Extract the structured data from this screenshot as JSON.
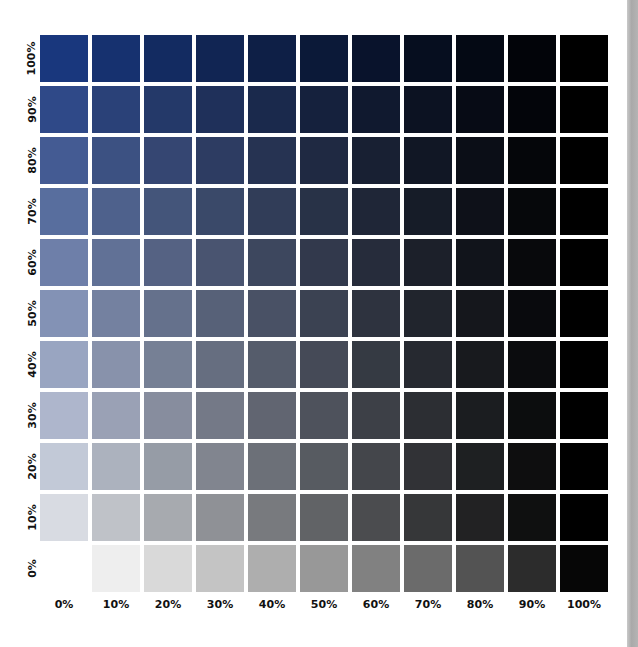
{
  "chart_data": {
    "type": "heatmap",
    "title": "",
    "xlabel": "",
    "ylabel": "",
    "x_categories": [
      "0%",
      "10%",
      "20%",
      "30%",
      "40%",
      "50%",
      "60%",
      "70%",
      "80%",
      "90%",
      "100%"
    ],
    "y_categories": [
      "100%",
      "90%",
      "80%",
      "70%",
      "60%",
      "50%",
      "40%",
      "30%",
      "20%",
      "10%",
      "0%"
    ],
    "grid": false,
    "legend": null,
    "base_color": "#19377d",
    "cells": [
      [
        "#19377d",
        "#16316f",
        "#132b61",
        "#112553",
        "#0e1f46",
        "#0b1938",
        "#09132c",
        "#060e1f",
        "#040914",
        "#020409",
        "#000000"
      ],
      [
        "#2f4988",
        "#2a4178",
        "#243969",
        "#1f305a",
        "#1a294c",
        "#15213d",
        "#10192f",
        "#0c1222",
        "#070b15",
        "#03050a",
        "#000000"
      ],
      [
        "#445b93",
        "#3c5182",
        "#354672",
        "#2d3c62",
        "#263352",
        "#1f2942",
        "#182033",
        "#111725",
        "#0b0e17",
        "#05060a",
        "#000000"
      ],
      [
        "#586e9e",
        "#4e618c",
        "#44557a",
        "#3a4969",
        "#313d58",
        "#283247",
        "#1f2637",
        "#161c28",
        "#0e1119",
        "#06080b",
        "#000000"
      ],
      [
        "#6e7fa9",
        "#617196",
        "#556283",
        "#495470",
        "#3d475e",
        "#32394c",
        "#262c3b",
        "#1c202a",
        "#11141b",
        "#08090c",
        "#000000"
      ],
      [
        "#8392b5",
        "#7481a0",
        "#65718c",
        "#576178",
        "#495165",
        "#3b4252",
        "#2e333f",
        "#21252d",
        "#15171c",
        "#090a0d",
        "#000000"
      ],
      [
        "#99a5c1",
        "#8892ab",
        "#768095",
        "#666e80",
        "#555c6b",
        "#454a57",
        "#353a43",
        "#262930",
        "#181a1e",
        "#0b0c0e",
        "#000000"
      ],
      [
        "#aeb6cc",
        "#9aa1b5",
        "#878d9e",
        "#747987",
        "#616571",
        "#4e525c",
        "#3d4047",
        "#2c2e33",
        "#1b1d20",
        "#0c0d0e",
        "#000000"
      ],
      [
        "#c2c9d7",
        "#acb2be",
        "#969ca6",
        "#81858f",
        "#6c7078",
        "#575b61",
        "#44464b",
        "#313236",
        "#1e2022",
        "#0e0e0f",
        "#000000"
      ],
      [
        "#d8dbe2",
        "#bfc2c8",
        "#a7aaaf",
        "#8f9196",
        "#787a7e",
        "#616366",
        "#4b4c4f",
        "#363739",
        "#222223",
        "#0f1010",
        "#000000"
      ],
      [
        "#ffffff",
        "#eeeeee",
        "#d9d9d9",
        "#c4c4c4",
        "#aeaeae",
        "#989898",
        "#818181",
        "#6b6b6b",
        "#535353",
        "#2c2c2c",
        "#060606"
      ]
    ]
  },
  "colors": {
    "background": "#ffffff",
    "label_text": "#111111",
    "side_strip": "#b0b0b0"
  }
}
